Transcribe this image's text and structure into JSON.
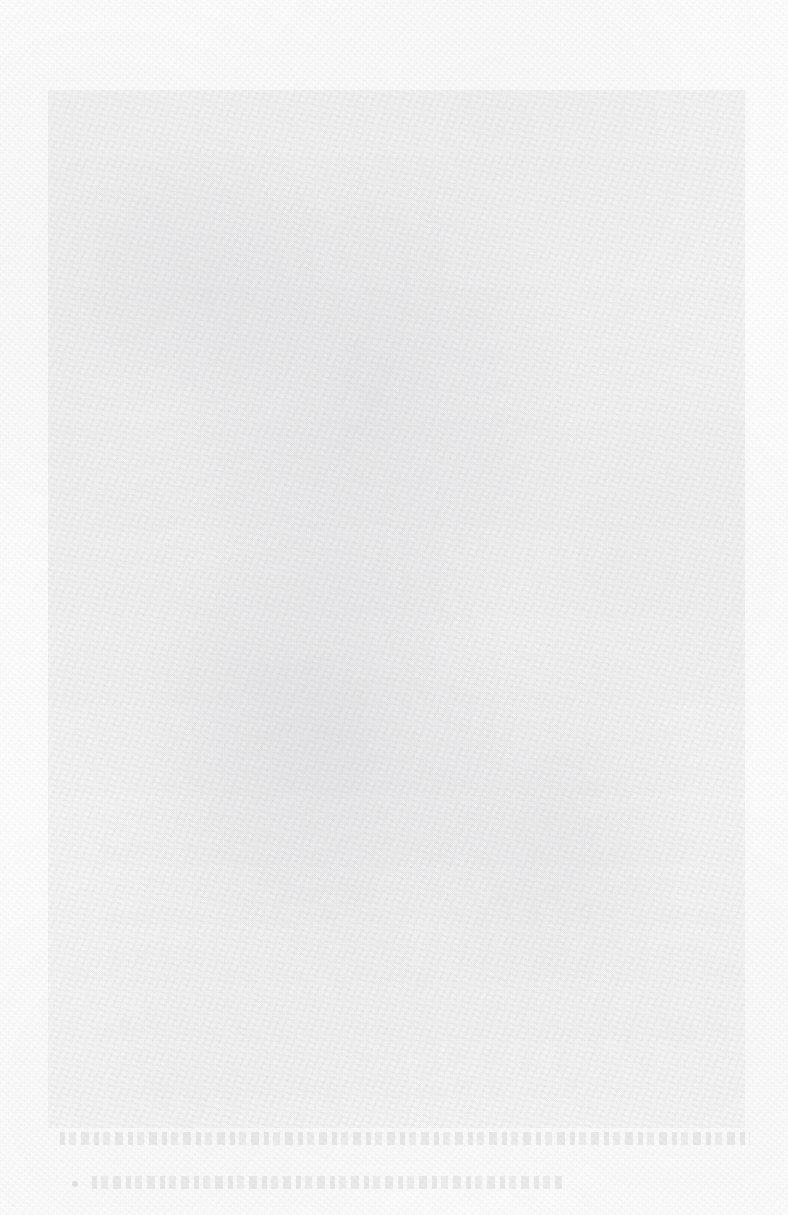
{
  "page": {
    "kind": "scanned-printed-page",
    "condition": "severely-faded",
    "width": 788,
    "height": 1215,
    "background_color": "#fefefe",
    "ink_color": "#70707a"
  },
  "plate": {
    "label": "",
    "alt": "",
    "x": 48,
    "y": 90,
    "width": 697,
    "height": 1038
  },
  "caption": {
    "line1": "",
    "line2": "",
    "bullet": ""
  }
}
